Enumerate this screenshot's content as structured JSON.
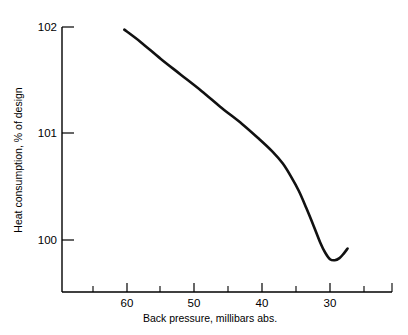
{
  "chart_data": {
    "type": "line",
    "title": "",
    "xlabel": "Back pressure, millibars abs.",
    "ylabel": "Heat consumption, % of design",
    "xlim": [
      65,
      26
    ],
    "ylim": [
      99.5,
      102
    ],
    "x_axis_reversed": true,
    "grid": false,
    "legend": null,
    "x_ticks_major": [
      60,
      50,
      40,
      30
    ],
    "x_tick_labels": [
      "60",
      "50",
      "40",
      "30"
    ],
    "x_ticks_minor": [
      65,
      55,
      45,
      35,
      27
    ],
    "y_ticks_major": [
      100,
      101,
      102
    ],
    "y_tick_labels": [
      "100",
      "101",
      "102"
    ],
    "series": [
      {
        "name": "Heat consumption",
        "x": [
          60.4,
          58.0,
          55.0,
          52.0,
          49.0,
          46.0,
          43.0,
          40.5,
          38.5,
          37.0,
          35.8,
          34.6,
          33.5,
          32.4,
          31.4,
          30.7,
          30.0,
          29.3,
          28.6,
          28.0,
          27.4
        ],
        "y": [
          101.975,
          101.86,
          101.7,
          101.55,
          101.4,
          101.24,
          101.09,
          100.95,
          100.83,
          100.72,
          100.6,
          100.46,
          100.3,
          100.13,
          99.97,
          99.88,
          99.82,
          99.81,
          99.83,
          99.87,
          99.92
        ]
      }
    ]
  },
  "axis_labels": {
    "x_title": "Back pressure, millibars abs.",
    "y_title": "Heat consumption, % of design"
  },
  "ticks": {
    "y": [
      "102",
      "101",
      "100"
    ],
    "x": [
      "60",
      "50",
      "40",
      "30"
    ]
  },
  "colors": {
    "line": "#111111",
    "axis": "#000000",
    "background": "#ffffff"
  }
}
